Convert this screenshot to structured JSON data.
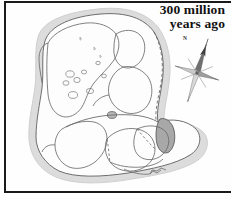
{
  "figure": {
    "kind": "paleogeographic-map",
    "title_line1": "300 million",
    "title_line2": "years ago",
    "frame_color": "#1a1a1a",
    "background_color": "#ffffff",
    "shelf_color": "#dcdcdc",
    "land_fill_color": "#fdfdfd",
    "coastline_color": "#6b6b6b",
    "highlight_land_color": "#a8a8a8",
    "suture_line_style": "dashed"
  },
  "compass": {
    "name": "compass-rose",
    "north_label": "N",
    "rotation_degrees": 18
  },
  "landmasses": [
    {
      "name": "laurasia-north-america",
      "label": ""
    },
    {
      "name": "laurasia-eurasia",
      "label": ""
    },
    {
      "name": "gondwana-south-america",
      "label": ""
    },
    {
      "name": "gondwana-africa",
      "label": ""
    },
    {
      "name": "gondwana-india",
      "label": ""
    },
    {
      "name": "gondwana-antarctica",
      "label": ""
    },
    {
      "name": "gondwana-australia",
      "label": ""
    }
  ]
}
